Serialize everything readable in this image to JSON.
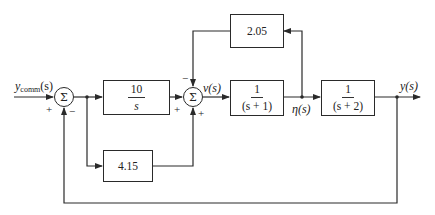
{
  "diagram": {
    "type": "control-system block diagram",
    "signals": {
      "input": "y",
      "input_sub": "comm",
      "input_arg": "(s)",
      "v": "v(s)",
      "eta": "η(s)",
      "output": "y(s)"
    },
    "summers": [
      {
        "id": "sum1",
        "symbol": "Σ",
        "signs": {
          "left": "+",
          "bottom": "−"
        }
      },
      {
        "id": "sum2",
        "symbol": "Σ",
        "signs": {
          "top": "−",
          "left": "+",
          "bottom": "+"
        }
      }
    ],
    "blocks": [
      {
        "id": "integrator",
        "num": "10",
        "den": "s"
      },
      {
        "id": "plant1",
        "num": "1",
        "den": "(s + 1)"
      },
      {
        "id": "plant2",
        "num": "1",
        "den": "(s + 2)"
      },
      {
        "id": "feedback_gain",
        "value": "2.05"
      },
      {
        "id": "proportional_gain",
        "value": "4.15"
      }
    ],
    "line_color": "#2a2a2a"
  }
}
